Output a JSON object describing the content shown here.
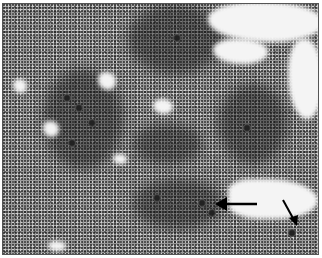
{
  "image": {
    "description": "Grayscale light-microscopy field of densely packed small cells with clusters of larger darker cells and clear empty regions",
    "annotations": [
      {
        "type": "arrow",
        "direction": "left",
        "label": ""
      },
      {
        "type": "arrow",
        "direction": "down-right",
        "label": ""
      }
    ]
  },
  "colors": {
    "background": "#9a9a9a",
    "clear_region": "#f4f4f4",
    "dark_cluster": "#222222",
    "arrow": "#000000"
  }
}
